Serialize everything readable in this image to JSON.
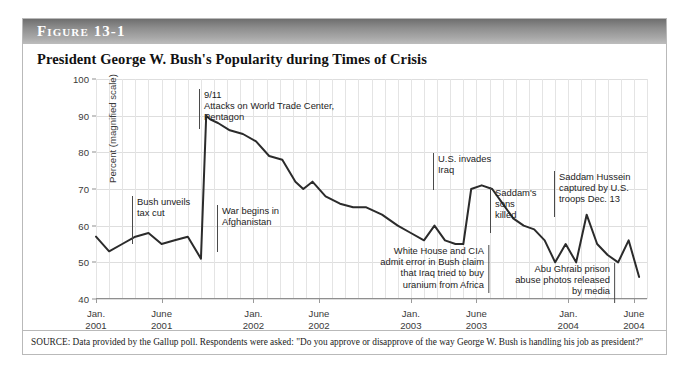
{
  "figure": {
    "header_label": "Figure 13-1",
    "title": "President George W. Bush's Popularity during Times of Crisis",
    "source": "SOURCE: Data provided by the Gallup poll. Respondents were asked: \"Do you approve or disapprove of the way George W. Bush is handling his job as president?\""
  },
  "chart_data": {
    "type": "line",
    "title": "President George W. Bush's Popularity during Times of Crisis",
    "xlabel": "",
    "ylabel": "Percent (magnified scale)",
    "ylim": [
      40,
      100
    ],
    "xlim": [
      0,
      42
    ],
    "grid": true,
    "legend": false,
    "y_ticks": [
      40,
      50,
      60,
      70,
      80,
      90,
      100
    ],
    "x_tick_labels": [
      {
        "value": 0,
        "line1": "Jan.",
        "line2": "2001"
      },
      {
        "value": 5,
        "line1": "June",
        "line2": "2001"
      },
      {
        "value": 12,
        "line1": "Jan.",
        "line2": "2002"
      },
      {
        "value": 17,
        "line1": "June",
        "line2": "2002"
      },
      {
        "value": 24,
        "line1": "Jan.",
        "line2": "2003"
      },
      {
        "value": 29,
        "line1": "June",
        "line2": "2003"
      },
      {
        "value": 36,
        "line1": "Jan.",
        "line2": "2004"
      },
      {
        "value": 41,
        "line1": "June",
        "line2": "2004"
      }
    ],
    "series": [
      {
        "name": "Presidential approval",
        "color": "#2b2b2b",
        "x": [
          0,
          1,
          2,
          3,
          4,
          5,
          6,
          7,
          8,
          8.4,
          8.7,
          9.3,
          10.2,
          11.2,
          12.2,
          13.2,
          14.2,
          15.2,
          15.8,
          16.5,
          17.5,
          18.6,
          19.6,
          20.6,
          21.8,
          23,
          24,
          25,
          25.8,
          26.6,
          27.4,
          28,
          28.6,
          29.4,
          30.2,
          31,
          31.8,
          32.6,
          33.4,
          34.2,
          35,
          35.8,
          36.6,
          37.4,
          38.2,
          39,
          39.8,
          40.6,
          41.4
        ],
        "y": [
          57,
          53,
          55,
          57,
          58,
          55,
          56,
          57,
          51,
          90,
          89,
          88,
          86,
          85,
          83,
          79,
          78,
          72,
          70,
          72,
          68,
          66,
          65,
          65,
          63,
          60,
          58,
          56,
          60,
          56,
          55,
          55,
          70,
          71,
          70,
          66,
          62,
          60,
          59,
          56,
          50,
          55,
          50,
          63,
          55,
          52,
          50,
          56,
          46
        ]
      }
    ],
    "annotations": [
      {
        "id": "bush-tax-cut",
        "text": "Bush unveils\ntax cut",
        "align": "left",
        "x_px": 131,
        "y_px": 195,
        "rule_height": 48
      },
      {
        "id": "nine-eleven",
        "text": "9/11\nAttacks on World Trade Center,\nPentagon",
        "align": "left",
        "x_px": 198,
        "y_px": 88,
        "rule_height": 40
      },
      {
        "id": "war-afghanistan",
        "text": "War begins in\nAfghanistan",
        "align": "left",
        "x_px": 216,
        "y_px": 204,
        "rule_height": 47
      },
      {
        "id": "wmd-uranium",
        "text": "White House and CIA\nadmit error in Bush claim\nthat Iraq tried to buy\nuranium from Africa",
        "align": "right",
        "x_px": 488,
        "y_px": 244,
        "rule_height": 48
      },
      {
        "id": "us-invades-iraq",
        "text": "U.S. invades\nIraq",
        "align": "left",
        "x_px": 432,
        "y_px": 152,
        "rule_height": 37
      },
      {
        "id": "saddam-sons-killed",
        "text": "Saddam's\nsons\nkilled",
        "align": "left",
        "x_px": 489,
        "y_px": 186,
        "rule_height": 46
      },
      {
        "id": "saddam-captured",
        "text": "Saddam Hussein\ncaptured by U.S.\ntroops Dec. 13",
        "align": "left",
        "x_px": 553,
        "y_px": 170,
        "rule_height": 46
      },
      {
        "id": "abu-ghraib",
        "text": "Abu Ghraib prison\nabuse photos released\nby media",
        "align": "right",
        "x_px": 614,
        "y_px": 262,
        "rule_height": 40
      }
    ]
  }
}
